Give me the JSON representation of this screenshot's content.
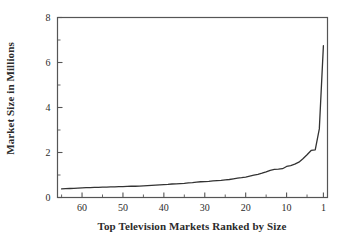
{
  "chart_data": {
    "type": "line",
    "title": "",
    "xlabel": "Top Television Markets Ranked by Size",
    "ylabel": "Market Size in Millions",
    "xlim": [
      66,
      0
    ],
    "ylim": [
      0,
      8
    ],
    "x_reversed": true,
    "grid": false,
    "legend": null,
    "x_ticks": [
      60,
      50,
      40,
      30,
      20,
      10,
      1
    ],
    "x_tick_labels": [
      "60",
      "50",
      "40",
      "30",
      "20",
      "10",
      "1"
    ],
    "x_minor_ticks": [
      65,
      55,
      45,
      35,
      25,
      15,
      5
    ],
    "y_ticks": [
      0,
      2,
      4,
      6,
      8
    ],
    "y_tick_labels": [
      "0",
      "2",
      "4",
      "6",
      "8"
    ],
    "y_minor_ticks": [
      1,
      3,
      5,
      7
    ],
    "series": [
      {
        "name": "Market size by rank",
        "x": [
          65,
          64,
          63,
          62,
          61,
          60,
          59,
          58,
          57,
          56,
          55,
          54,
          53,
          52,
          51,
          50,
          49,
          48,
          47,
          46,
          45,
          44,
          43,
          42,
          41,
          40,
          39,
          38,
          37,
          36,
          35,
          34,
          33,
          32,
          31,
          30,
          29,
          28,
          27,
          26,
          25,
          24,
          23,
          22,
          21,
          20,
          19,
          18,
          17,
          16,
          15,
          14,
          13,
          12,
          11,
          10,
          9,
          8,
          7,
          6,
          5,
          4,
          3,
          2,
          1
        ],
        "values": [
          0.38,
          0.39,
          0.4,
          0.41,
          0.42,
          0.43,
          0.44,
          0.44,
          0.45,
          0.45,
          0.46,
          0.46,
          0.47,
          0.47,
          0.48,
          0.48,
          0.49,
          0.5,
          0.5,
          0.51,
          0.52,
          0.53,
          0.54,
          0.55,
          0.56,
          0.57,
          0.58,
          0.6,
          0.61,
          0.62,
          0.63,
          0.65,
          0.66,
          0.68,
          0.7,
          0.71,
          0.72,
          0.74,
          0.75,
          0.76,
          0.78,
          0.8,
          0.83,
          0.86,
          0.88,
          0.91,
          0.95,
          0.99,
          1.03,
          1.08,
          1.14,
          1.21,
          1.25,
          1.26,
          1.28,
          1.38,
          1.42,
          1.48,
          1.57,
          1.72,
          1.9,
          2.09,
          2.12,
          3.05,
          6.75
        ]
      }
    ],
    "line_color": "#333333",
    "axis_color": "#555555"
  }
}
